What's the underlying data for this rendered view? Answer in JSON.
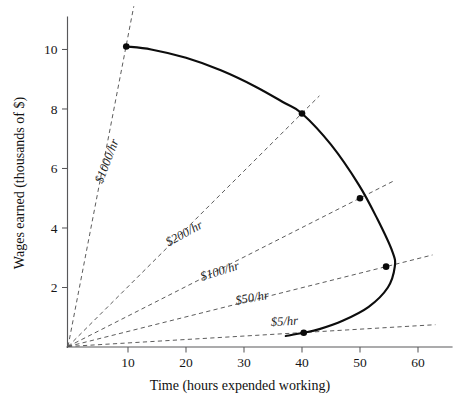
{
  "chart_data": {
    "type": "line",
    "title": "",
    "subtitle": "",
    "xlabel": "Time (hours expended working)",
    "ylabel": "Wages earned (thousands of $)",
    "xlim": [
      0,
      64
    ],
    "ylim": [
      0,
      11.3
    ],
    "grid": false,
    "legend_position": "none",
    "x_ticks": [
      10,
      20,
      30,
      40,
      50,
      60
    ],
    "x_tick_labels": [
      "10",
      "20",
      "30",
      "40",
      "50",
      "60"
    ],
    "y_ticks": [
      2,
      4,
      6,
      8,
      10
    ],
    "y_tick_labels": [
      "2",
      "4",
      "6",
      "8",
      "10"
    ],
    "series": [
      {
        "name": "labour-supply-curve",
        "type": "line",
        "style": "solid",
        "color": "#0d0d0d",
        "x": [
          9.7,
          14.0,
          20.0,
          26.0,
          32.0,
          37.0,
          40.0,
          45.0,
          49.8,
          53.0,
          55.6,
          56.0,
          54.8,
          51.5,
          47.0,
          43.0,
          40.3,
          37.2
        ],
        "y": [
          10.1,
          10.0,
          9.72,
          9.3,
          8.75,
          8.2,
          7.85,
          6.8,
          5.45,
          4.3,
          3.2,
          2.7,
          2.0,
          1.35,
          0.88,
          0.6,
          0.48,
          0.37
        ]
      }
    ],
    "points": [
      {
        "label": "$1000/hr point",
        "x": 9.7,
        "y": 10.1
      },
      {
        "label": "$200/hr point",
        "x": 40.0,
        "y": 7.85
      },
      {
        "label": "$100/hr point",
        "x": 50.0,
        "y": 5.0
      },
      {
        "label": "$50/hr point",
        "x": 54.5,
        "y": 2.7
      },
      {
        "label": "$5/hr point",
        "x": 40.3,
        "y": 0.48
      }
    ],
    "rays": [
      {
        "label": "$1000/hr",
        "rate": 1000,
        "slope_thousands_per_hour": 1.0412,
        "x_end": 11.0,
        "label_x": 7.0,
        "label_y": 6.2,
        "label_angle": -69
      },
      {
        "label": "$200/hr",
        "rate": 200,
        "slope_thousands_per_hour": 0.1963,
        "x_end": 43.0,
        "label_x": 20.0,
        "label_y": 3.7,
        "label_angle": -29
      },
      {
        "label": "$100/hr",
        "rate": 100,
        "slope_thousands_per_hour": 0.1,
        "x_end": 56.0,
        "label_x": 26.0,
        "label_y": 2.42,
        "label_angle": -17
      },
      {
        "label": "$50/hr",
        "rate": 50,
        "slope_thousands_per_hour": 0.0495,
        "x_end": 62.5,
        "label_x": 31.5,
        "label_y": 1.52,
        "label_angle": -10
      },
      {
        "label": "$5/hr",
        "rate": 5,
        "slope_thousands_per_hour": 0.0119,
        "x_end": 63.0,
        "label_x": 37.0,
        "label_y": 0.73,
        "label_angle": -3
      }
    ]
  }
}
